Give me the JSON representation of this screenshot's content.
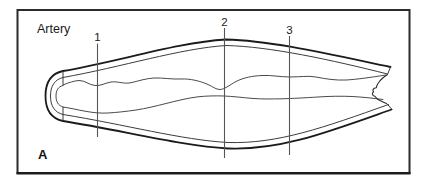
{
  "figure": {
    "title": "Artery",
    "panel_label": "A",
    "colors": {
      "background": "#ffffff",
      "border": "#2b2b2b",
      "line": "#1b1b1b"
    },
    "title_pos": {
      "x": 37,
      "y": 33
    },
    "panel_label_pos": {
      "x": 38,
      "y": 159
    },
    "section_markers": [
      {
        "label": "1",
        "x": 97.5,
        "label_y": 41,
        "line_y1": 43.5,
        "line_y2": 137
      },
      {
        "label": "2",
        "x": 224.5,
        "label_y": 25.5,
        "line_y1": 28,
        "line_y2": 158
      },
      {
        "label": "3",
        "x": 289.5,
        "label_y": 33.5,
        "line_y1": 36,
        "line_y2": 155
      }
    ]
  }
}
